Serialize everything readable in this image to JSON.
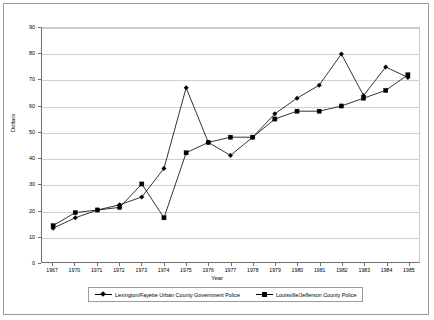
{
  "chart_data": {
    "type": "line",
    "title": "",
    "xlabel": "Year",
    "ylabel": "Dollars",
    "categories": [
      "1967",
      "1970",
      "1971",
      "1972",
      "1973",
      "1974",
      "1975",
      "1976",
      "1977",
      "1978",
      "1979",
      "1980",
      "1981",
      "1982",
      "1983",
      "1984",
      "1985"
    ],
    "ylim": [
      0,
      90
    ],
    "ytick_values": [
      0,
      10,
      20,
      30,
      40,
      50,
      60,
      70,
      80,
      90
    ],
    "grid": true,
    "legend_position": "bottom",
    "series": [
      {
        "name": "Lexington/Fayette Urban County Government Police",
        "marker": "diamond",
        "values": [
          13,
          17,
          20,
          22,
          25,
          36,
          67,
          46,
          41,
          48,
          57,
          63,
          68,
          80,
          64,
          75,
          71
        ]
      },
      {
        "name": "Louisville/Jefferson County Police",
        "marker": "square",
        "values": [
          14,
          19,
          20,
          21,
          30,
          17,
          42,
          46,
          48,
          48,
          55,
          58,
          58,
          60,
          63,
          66,
          72
        ]
      }
    ]
  },
  "axes": {
    "ylabel": "Dollars",
    "xlabel": "Year",
    "ytick_labels": [
      "90",
      "80",
      "70",
      "60",
      "50",
      "40",
      "30",
      "20",
      "10",
      "0"
    ],
    "xtick_labels": [
      "1967",
      "1970",
      "1971",
      "1972",
      "1973",
      "1974",
      "1975",
      "1976",
      "1977",
      "1978",
      "1979",
      "1980",
      "1981",
      "1982",
      "1983",
      "1984",
      "1985"
    ]
  },
  "legend": {
    "items": [
      {
        "label": "Lexington/Fayette Urban County Government Police",
        "marker": "diamond"
      },
      {
        "label": "Louisville/Jefferson County Police",
        "marker": "square"
      }
    ]
  }
}
